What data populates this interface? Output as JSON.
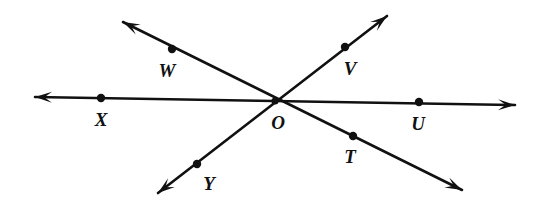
{
  "figure": {
    "type": "geometry-line-diagram",
    "background_color": "#ffffff",
    "stroke_color": "#111111",
    "label_color": "#111111",
    "width": 554,
    "height": 206
  },
  "points": [
    {
      "id": "W",
      "label": "W",
      "dot_x": 172,
      "dot_y": 49,
      "label_x": 167,
      "label_y": 70
    },
    {
      "id": "V",
      "label": "V",
      "dot_x": 345,
      "dot_y": 47,
      "label_x": 350,
      "label_y": 68
    },
    {
      "id": "X",
      "label": "X",
      "dot_x": 101,
      "dot_y": 98,
      "label_x": 101,
      "label_y": 119
    },
    {
      "id": "O",
      "label": "O",
      "dot_x": 275,
      "dot_y": 101,
      "label_x": 278,
      "label_y": 122
    },
    {
      "id": "U",
      "label": "U",
      "dot_x": 419,
      "dot_y": 102,
      "label_x": 418,
      "label_y": 123
    },
    {
      "id": "T",
      "label": "T",
      "dot_x": 353,
      "dot_y": 136,
      "label_x": 350,
      "label_y": 156
    },
    {
      "id": "Y",
      "label": "Y",
      "dot_x": 197,
      "dot_y": 164,
      "label_x": 209,
      "label_y": 183
    }
  ],
  "lines": [
    {
      "id": "line-XU",
      "name": "horizontal-line-through-X-O-U",
      "through": [
        "X",
        "O",
        "U"
      ],
      "x1": 35,
      "y1": 97,
      "x2": 515,
      "y2": 105,
      "arrow_start": true,
      "arrow_end": true
    },
    {
      "id": "line-WT",
      "name": "diagonal-line-through-W-O-T",
      "through": [
        "W",
        "O",
        "T"
      ],
      "x1": 123,
      "y1": 22,
      "x2": 462,
      "y2": 190,
      "arrow_start": true,
      "arrow_end": true
    },
    {
      "id": "line-VY",
      "name": "diagonal-line-through-V-O-Y",
      "through": [
        "V",
        "O",
        "Y"
      ],
      "x1": 387,
      "y1": 16,
      "x2": 158,
      "y2": 193,
      "arrow_start": true,
      "arrow_end": true
    }
  ],
  "style": {
    "line_width": 2.6,
    "dot_radius": 4.2,
    "arrow_length": 17,
    "arrow_half_width": 5.5
  }
}
